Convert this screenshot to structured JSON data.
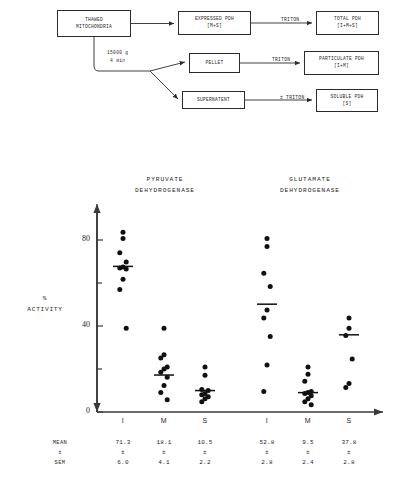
{
  "flow": {
    "boxes": [
      {
        "name": "thawed-mitochondria",
        "lines": [
          "THAWED",
          "MITOCHONDRIA"
        ],
        "x": 57,
        "y": 10,
        "w": 74,
        "h": 27
      },
      {
        "name": "expressed-pdh",
        "lines": [
          "EXPRESSED PDH",
          "[M+S]"
        ],
        "x": 178,
        "y": 11,
        "w": 73,
        "h": 24
      },
      {
        "name": "total-pdh",
        "lines": [
          "TOTAL PDH",
          "[I+M+S]"
        ],
        "x": 316,
        "y": 11,
        "w": 63,
        "h": 24
      },
      {
        "name": "pellet",
        "lines": [
          "PELLET"
        ],
        "x": 189,
        "y": 53,
        "w": 51,
        "h": 20
      },
      {
        "name": "particulate-pdh",
        "lines": [
          "PARTICULATE PDH",
          "[I+M]"
        ],
        "x": 304,
        "y": 51,
        "w": 75,
        "h": 24
      },
      {
        "name": "supernatent",
        "lines": [
          "SUPERNATENT"
        ],
        "x": 182,
        "y": 91,
        "w": 63,
        "h": 18
      },
      {
        "name": "soluble-pdh",
        "lines": [
          "SOLUBLE PDH",
          "[S]"
        ],
        "x": 316,
        "y": 89,
        "w": 62,
        "h": 23
      }
    ],
    "edge_labels": [
      {
        "name": "triton-total",
        "text": "TRITON",
        "x": 281,
        "y": 17
      },
      {
        "name": "triton-particulate",
        "text": "TRITON",
        "x": 272,
        "y": 57
      },
      {
        "name": "triton-soluble",
        "text": "± TRITON",
        "x": 280,
        "y": 95
      }
    ],
    "centrifuge": {
      "name": "centrifugation-note",
      "line1": "15000 g",
      "line2": "4 min",
      "x": 107,
      "y": 49
    }
  },
  "chart_data": {
    "type": "scatter",
    "title": "",
    "xlabel": "",
    "ylabel": "%\nACTIVITY",
    "ylabel_lines": [
      "%",
      "ACTIVITY"
    ],
    "ylim": [
      0,
      95
    ],
    "yticks_major": [
      0,
      40,
      80
    ],
    "yticks_minor": [
      20,
      60
    ],
    "grid": false,
    "legend": "none",
    "panels": [
      {
        "name": "pyruvate-dehydrogenase",
        "title_lines": [
          "PYRUVATE",
          "DEHYDROGENASE"
        ],
        "categories": [
          "I",
          "M",
          "S"
        ],
        "groups": [
          {
            "category": "I",
            "mean": 71.3,
            "sem": 6.0,
            "points": [
              88.0,
              85.0,
              78.0,
              73.5,
              71.0,
              70.5,
              70.0,
              65.0,
              60.0,
              41.0
            ]
          },
          {
            "category": "M",
            "mean": 18.1,
            "sem": 4.1,
            "points": [
              41.0,
              28.0,
              26.5,
              22.0,
              21.0,
              19.5,
              17.0,
              13.0,
              9.5,
              6.0
            ]
          },
          {
            "category": "S",
            "mean": 10.5,
            "sem": 2.2,
            "points": [
              22.0,
              18.0,
              11.0,
              10.5,
              9.0,
              8.5,
              7.5,
              6.5,
              5.0
            ]
          }
        ]
      },
      {
        "name": "glutamate-dehydrogenase",
        "title_lines": [
          "GLUTAMATE",
          "DEHYDROGENASE"
        ],
        "categories": [
          "I",
          "M",
          "S"
        ],
        "groups": [
          {
            "category": "I",
            "mean": 52.8,
            "sem": 2.8,
            "points": [
              85.0,
              81.0,
              68.0,
              61.5,
              50.0,
              46.0,
              37.0,
              23.0,
              10.0
            ]
          },
          {
            "category": "M",
            "mean": 9.5,
            "sem": 2.4,
            "points": [
              22.0,
              18.5,
              15.0,
              10.0,
              9.5,
              9.0,
              8.0,
              6.5,
              5.0,
              3.5
            ]
          },
          {
            "category": "S",
            "mean": 37.8,
            "sem": 2.8,
            "points": [
              46.0,
              41.0,
              37.5,
              26.0,
              14.0,
              12.0
            ]
          }
        ]
      }
    ]
  },
  "stats": {
    "row_labels": [
      "MEAN",
      "±",
      "SEM"
    ],
    "columns": [
      {
        "category": "I",
        "mean": "71.3",
        "sep": "±",
        "sem": "6.0"
      },
      {
        "category": "M",
        "mean": "18.1",
        "sep": "±",
        "sem": "4.1"
      },
      {
        "category": "S",
        "mean": "10.5",
        "sep": "±",
        "sem": "2.2"
      },
      {
        "category": "I",
        "mean": "52.8",
        "sep": "±",
        "sem": "2.8"
      },
      {
        "category": "M",
        "mean": "9.5",
        "sep": "±",
        "sem": "2.4"
      },
      {
        "category": "S",
        "mean": "37.8",
        "sep": "±",
        "sem": "2.8"
      }
    ]
  },
  "colors": {
    "ink": "#1f1f1f",
    "axis": "#3a3a3a",
    "point": "#111111",
    "background": "#ffffff"
  }
}
